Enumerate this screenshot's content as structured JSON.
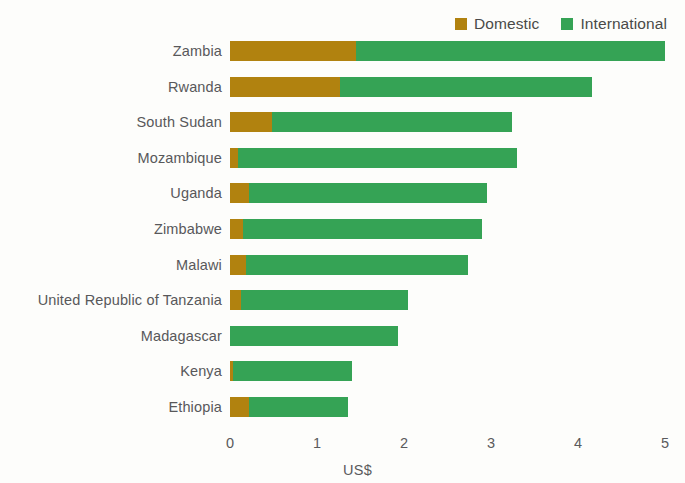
{
  "legend": {
    "position": "top-right",
    "entries": [
      {
        "label": "Domestic",
        "color": "#b1820f",
        "icon": "square-swatch-icon"
      },
      {
        "label": "International",
        "color": "#35a355",
        "icon": "square-swatch-icon"
      }
    ]
  },
  "axis": {
    "x_title": "US$",
    "x_ticks": [
      "0",
      "1",
      "2",
      "3",
      "4",
      "5"
    ],
    "x_tick_values": [
      0,
      1,
      2,
      3,
      4,
      5
    ],
    "xlim": [
      0,
      5
    ]
  },
  "chart_data": {
    "type": "bar",
    "orientation": "horizontal",
    "stacked": true,
    "title": "",
    "subtitle": "",
    "xlabel": "US$",
    "ylabel": "",
    "xlim": [
      0,
      5
    ],
    "grid": false,
    "legend_position": "top-right",
    "categories": [
      "Zambia",
      "Rwanda",
      "South Sudan",
      "Mozambique",
      "Uganda",
      "Zimbabwe",
      "Malawi",
      "United Republic of Tanzania",
      "Madagascar",
      "Kenya",
      "Ethiopia"
    ],
    "series": [
      {
        "name": "Domestic",
        "color": "#b1820f",
        "values": [
          1.45,
          1.26,
          0.48,
          0.09,
          0.22,
          0.15,
          0.18,
          0.13,
          0.0,
          0.03,
          0.22
        ]
      },
      {
        "name": "International",
        "color": "#35a355",
        "values": [
          3.55,
          2.9,
          2.76,
          3.21,
          2.73,
          2.75,
          2.56,
          1.92,
          1.93,
          1.37,
          1.14
        ]
      }
    ],
    "totals": [
      5.0,
      4.16,
      3.24,
      3.3,
      2.95,
      2.9,
      2.74,
      2.05,
      1.93,
      1.4,
      1.36
    ]
  }
}
